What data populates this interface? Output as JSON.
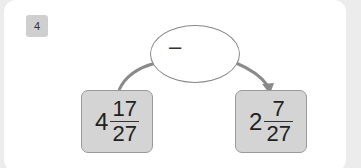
{
  "question": {
    "number": "4"
  },
  "operation": {
    "symbol": "–"
  },
  "left_box": {
    "whole": "4",
    "numerator": "17",
    "denominator": "27"
  },
  "right_box": {
    "whole": "2",
    "numerator": "7",
    "denominator": "27"
  },
  "colors": {
    "box_fill": "#d4d4d4",
    "arrow": "#8a8a8a",
    "badge": "#cfcfcf"
  }
}
